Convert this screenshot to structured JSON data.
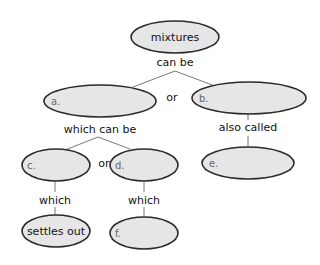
{
  "colors": {
    "node_fill": "#e6e6e6",
    "node_stroke": "#2a2a2a",
    "line": "#555555",
    "text": "#111111",
    "letter": "#777777",
    "background": "#ffffff"
  },
  "nodes": {
    "root": {
      "text": "mixtures"
    },
    "a": {
      "letter": "a.",
      "text": ""
    },
    "b": {
      "letter": "b.",
      "text": ""
    },
    "c": {
      "letter": "c.",
      "text": ""
    },
    "d": {
      "letter": "d.",
      "text": ""
    },
    "e": {
      "letter": "e.",
      "text": ""
    },
    "f": {
      "letter": "f.",
      "text": ""
    },
    "settles": {
      "text": "settles out"
    }
  },
  "links": {
    "root_to_ab": "can be",
    "or_ab": "or",
    "a_to_cd": "which can be",
    "or_cd": "or",
    "b_to_e": "also called",
    "c_to_settles": "which",
    "d_to_f": "which"
  }
}
